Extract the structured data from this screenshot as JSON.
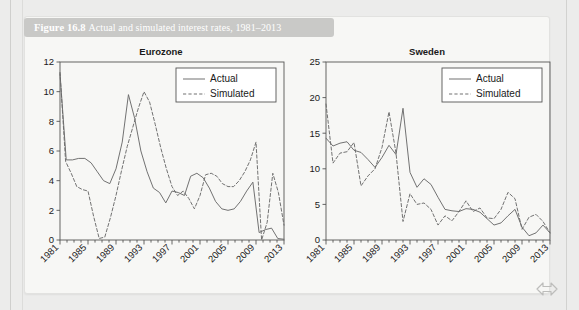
{
  "figure": {
    "number": "Figure 16.8",
    "caption": "Actual and simulated interest rates, 1981–2013",
    "full_caption": "Figure 16.8  Actual and simulated interest rates, 1981–2013"
  },
  "legend": {
    "actual_label": "Actual",
    "simulated_label": "Simulated"
  },
  "colors": {
    "caption_bar": "#c9c9c7",
    "caption_text": "#ffffff",
    "page_background": "#ececeb",
    "figure_background": "#f7f7f5",
    "line": "#6a6a6a",
    "axis": "#555555"
  },
  "chart_data": [
    {
      "type": "line",
      "title": "Eurozone",
      "xlabel": "",
      "ylabel": "",
      "ylim": [
        0,
        12
      ],
      "yticks": [
        0,
        2,
        4,
        6,
        8,
        10,
        12
      ],
      "ytick_labels": [
        "0",
        "2",
        "4",
        "6",
        "8",
        "10",
        "12"
      ],
      "xlim": [
        1981,
        2013
      ],
      "xticks": [
        1981,
        1985,
        1989,
        1993,
        1997,
        2001,
        2005,
        2009,
        2013
      ],
      "xtick_labels": [
        "1981",
        "1985",
        "1989",
        "1993",
        "1997",
        "2001",
        "2005",
        "2009",
        "2013"
      ],
      "grid": false,
      "legend_position": "top-right",
      "x": [
        1981,
        1982,
        1983,
        1984,
        1985,
        1986,
        1987,
        1988,
        1989,
        1990,
        1991,
        1992,
        1993,
        1994,
        1995,
        1996,
        1997,
        1998,
        1999,
        2000,
        2001,
        2002,
        2003,
        2004,
        2005,
        2006,
        2007,
        2008,
        2009,
        2010,
        2011,
        2012,
        2013
      ],
      "series": [
        {
          "name": "Actual",
          "style": "solid",
          "values": [
            11.2,
            5.4,
            5.4,
            5.5,
            5.5,
            5.2,
            4.6,
            4.0,
            3.8,
            4.8,
            6.6,
            9.8,
            8.2,
            6.0,
            4.6,
            3.5,
            3.2,
            2.5,
            3.3,
            3.2,
            3.0,
            4.3,
            4.5,
            4.2,
            3.5,
            2.6,
            2.1,
            2.0,
            2.1,
            2.6,
            3.3,
            3.9,
            0.5,
            0.7,
            0.8,
            0.1,
            0.05
          ]
        },
        {
          "name": "Simulated",
          "style": "dashed",
          "values": [
            11.3,
            5.3,
            4.5,
            3.6,
            3.4,
            3.3,
            1.6,
            0.1,
            0.2,
            1.5,
            3.0,
            4.7,
            6.3,
            7.6,
            8.9,
            10.0,
            9.3,
            7.8,
            6.2,
            4.8,
            3.6,
            3.0,
            3.3,
            2.8,
            2.1,
            3.0,
            4.4,
            4.5,
            4.3,
            3.8,
            3.6,
            3.6,
            4.0,
            4.6,
            5.4,
            6.6,
            0.0,
            1.2,
            4.5,
            3.2,
            1.0
          ]
        }
      ]
    },
    {
      "type": "line",
      "title": "Sweden",
      "xlabel": "",
      "ylabel": "",
      "ylim": [
        0,
        25
      ],
      "yticks": [
        0,
        5,
        10,
        15,
        20,
        25
      ],
      "ytick_labels": [
        "0",
        "5",
        "10",
        "15",
        "20",
        "25"
      ],
      "xlim": [
        1981,
        2013
      ],
      "xticks": [
        1981,
        1985,
        1989,
        1993,
        1997,
        2001,
        2005,
        2009,
        2013
      ],
      "xtick_labels": [
        "1981",
        "1985",
        "1989",
        "1993",
        "1997",
        "2001",
        "2005",
        "2009",
        "2013"
      ],
      "grid": false,
      "legend_position": "top-right",
      "x": [
        1981,
        1982,
        1983,
        1984,
        1985,
        1986,
        1987,
        1988,
        1989,
        1990,
        1991,
        1992,
        1993,
        1994,
        1995,
        1996,
        1997,
        1998,
        1999,
        2000,
        2001,
        2002,
        2003,
        2004,
        2005,
        2006,
        2007,
        2008,
        2009,
        2010,
        2011,
        2012,
        2013
      ],
      "series": [
        {
          "name": "Actual",
          "style": "solid",
          "values": [
            14.3,
            13.2,
            13.6,
            13.8,
            12.6,
            12.3,
            11.3,
            10.2,
            11.6,
            13.3,
            12.0,
            18.5,
            9.5,
            7.4,
            8.6,
            7.8,
            6.0,
            4.3,
            4.1,
            4.0,
            4.4,
            4.3,
            3.9,
            3.0,
            2.1,
            2.4,
            3.4,
            4.3,
            1.8,
            0.6,
            1.0,
            2.1,
            1.0
          ]
        },
        {
          "name": "Simulated",
          "style": "dashed",
          "values": [
            19.1,
            10.8,
            12.2,
            12.4,
            13.7,
            7.6,
            9.0,
            10.0,
            13.0,
            18.0,
            12.2,
            2.6,
            6.5,
            5.0,
            5.2,
            4.3,
            2.1,
            3.4,
            2.7,
            4.0,
            5.5,
            4.0,
            4.5,
            3.1,
            3.0,
            4.3,
            6.7,
            5.8,
            1.5,
            3.2,
            3.6,
            2.6,
            1.0
          ]
        }
      ]
    }
  ]
}
